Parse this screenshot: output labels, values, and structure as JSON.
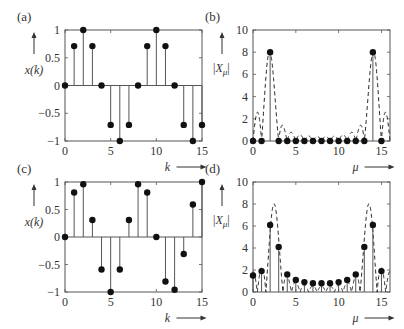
{
  "chart_data": [
    {
      "id": "a",
      "panel_label": "(a)",
      "type": "stem",
      "ylabel": "x(k)",
      "xlabel": "k",
      "xlim": [
        0,
        15
      ],
      "ylim": [
        -1,
        1
      ],
      "xticks": [
        0,
        5,
        10,
        15
      ],
      "yticks": [
        -1,
        -0.5,
        0,
        0.5,
        1
      ],
      "ytick_labels": [
        "−1",
        "−0.5",
        "0",
        "0.5",
        "1"
      ],
      "x": [
        0,
        1,
        2,
        3,
        4,
        5,
        6,
        7,
        8,
        9,
        10,
        11,
        12,
        13,
        14,
        15
      ],
      "values": [
        0,
        0.71,
        1,
        0.71,
        0,
        -0.71,
        -1,
        -0.71,
        0,
        0.71,
        1,
        0.71,
        0,
        -0.71,
        -1,
        -0.71
      ],
      "frame": {
        "left": 65,
        "top": 30,
        "right": 202,
        "bottom": 141
      }
    },
    {
      "id": "b",
      "panel_label": "(b)",
      "type": "stem+dashed-line",
      "ylabel": "|X_μ|",
      "xlabel": "μ",
      "xlim": [
        0,
        16
      ],
      "ylim": [
        0,
        10
      ],
      "xticks": [
        0,
        5,
        10,
        15
      ],
      "yticks": [
        0,
        2,
        4,
        6,
        8,
        10
      ],
      "ytick_labels": [
        "0",
        "2",
        "4",
        "6",
        "8",
        "10"
      ],
      "x": [
        0,
        1,
        2,
        3,
        4,
        5,
        6,
        7,
        8,
        9,
        10,
        11,
        12,
        13,
        14,
        15
      ],
      "values": [
        0,
        0,
        8,
        0,
        0,
        0,
        0,
        0,
        0,
        0,
        0,
        0,
        0,
        0,
        8,
        0
      ],
      "dashed_curve": "interpolated spectrum (zero-padded DFT magnitude)",
      "signal_freq": 2,
      "frame": {
        "left": 253,
        "top": 30,
        "right": 390,
        "bottom": 141
      }
    },
    {
      "id": "c",
      "panel_label": "(c)",
      "type": "stem",
      "ylabel": "x(k)",
      "xlabel": "k",
      "xlim": [
        0,
        15
      ],
      "ylim": [
        -1,
        1
      ],
      "xticks": [
        0,
        5,
        10,
        15
      ],
      "yticks": [
        -1,
        -0.5,
        0,
        0.5,
        1
      ],
      "ytick_labels": [
        "−1",
        "−0.5",
        "0",
        "0.5",
        "1"
      ],
      "x": [
        0,
        1,
        2,
        3,
        4,
        5,
        6,
        7,
        8,
        9,
        10,
        11,
        12,
        13,
        14,
        15
      ],
      "values": [
        0,
        0.81,
        0.96,
        0.31,
        -0.59,
        -1,
        -0.59,
        0.31,
        0.96,
        0.81,
        0,
        -0.81,
        -0.96,
        -0.31,
        0.59,
        1
      ],
      "frame": {
        "left": 65,
        "top": 182,
        "right": 202,
        "bottom": 292
      }
    },
    {
      "id": "d",
      "panel_label": "(d)",
      "type": "stem+dashed-line",
      "ylabel": "|X_μ|",
      "xlabel": "μ",
      "xlim": [
        0,
        16
      ],
      "ylim": [
        0,
        10
      ],
      "xticks": [
        0,
        5,
        10,
        15
      ],
      "yticks": [
        0,
        2,
        4,
        6,
        8,
        10
      ],
      "ytick_labels": [
        "0",
        "2",
        "4",
        "6",
        "8",
        "10"
      ],
      "x": [
        0,
        1,
        2,
        3,
        4,
        5,
        6,
        7,
        8,
        9,
        10,
        11,
        12,
        13,
        14,
        15
      ],
      "values": [
        1.5,
        1.9,
        6.1,
        4.1,
        1.6,
        1.1,
        0.9,
        0.8,
        0.8,
        0.8,
        0.9,
        1.1,
        1.6,
        4.1,
        6.1,
        1.9
      ],
      "dashed_curve": "interpolated spectrum (zero-padded DFT magnitude)",
      "signal_freq": 2.5,
      "frame": {
        "left": 253,
        "top": 182,
        "right": 390,
        "bottom": 292
      }
    }
  ]
}
